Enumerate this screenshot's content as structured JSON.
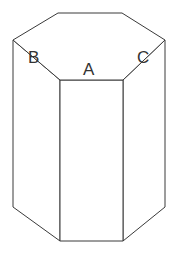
{
  "figure": {
    "kind": "hexagonal-prism-line-drawing",
    "width": 177,
    "height": 255,
    "background_color": "#ffffff",
    "stroke_color": "#3a3a3a",
    "fill_color": "#ffffff",
    "stroke_width": 1,
    "label_color": "#333333",
    "labels": [
      {
        "id": "A",
        "text": "A",
        "face": "front-face",
        "x": 83,
        "y": 61
      },
      {
        "id": "B",
        "text": "B",
        "face": "left-front-face",
        "x": 28,
        "y": 49
      },
      {
        "id": "C",
        "text": "C",
        "face": "right-front-face",
        "x": 137,
        "y": 49
      }
    ],
    "vertices": {
      "top_back_left": [
        58,
        13
      ],
      "top_back_right": [
        122,
        13
      ],
      "top_right": [
        165,
        40
      ],
      "top_front_right": [
        123,
        80
      ],
      "top_front_left": [
        60,
        80
      ],
      "top_left": [
        13,
        40
      ],
      "bottom_left": [
        13,
        207
      ],
      "bottom_front_left": [
        60,
        241
      ],
      "bottom_front_right": [
        123,
        241
      ],
      "bottom_right": [
        165,
        207
      ]
    },
    "polygons": {
      "top_face": "58,13 122,13 165,40 123,80 60,80 13,40",
      "left_front_face": "13,40 60,80 60,241 13,207",
      "front_face": "60,80 123,80 123,241 60,241",
      "right_front_face": "123,80 165,40 165,207 123,241"
    }
  }
}
